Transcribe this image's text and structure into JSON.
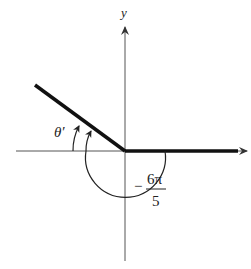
{
  "diagram": {
    "type": "angle-in-standard-position",
    "axes": {
      "y_label": "y",
      "x_label": ""
    },
    "angle": {
      "label_minus": "−",
      "label_numerator": "6π",
      "label_denominator": "5",
      "value_text": "−6π/5",
      "direction": "clockwise"
    },
    "reference_angle": {
      "label": "θ′"
    },
    "colors": {
      "line": "#111111",
      "axis": "#444444",
      "background": "#ffffff"
    }
  }
}
